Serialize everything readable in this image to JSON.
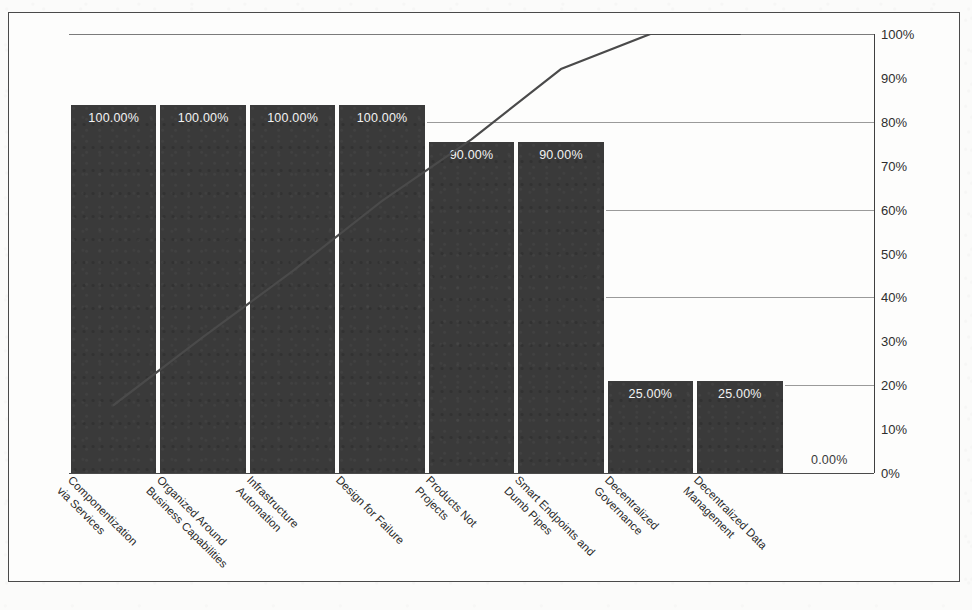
{
  "chart_data": {
    "type": "bar",
    "title": "",
    "subtitle": "",
    "xlabel": "",
    "ylabel": "",
    "ylim": [
      0,
      100
    ],
    "grid": true,
    "legend": "none",
    "categories": [
      "Componentization\nvia Services",
      "Organized Around\nBusiness Capabilities",
      "Infrastructure\nAutomation",
      "Design for Failure",
      "Products Not\nProjects",
      "Smart Endpoints and\nDumb Pipes",
      "Decentralized\nGovernance",
      "Decentralized Data\nManagement"
    ],
    "series": [
      {
        "name": "Percentage",
        "kind": "bar",
        "values": [
          100.0,
          100.0,
          100.0,
          100.0,
          90.0,
          90.0,
          25.0,
          25.0
        ],
        "labels": [
          "100.00%",
          "100.00%",
          "100.00%",
          "100.00%",
          "90.00%",
          "90.00%",
          "25.00%",
          "25.00%"
        ]
      },
      {
        "name": "Cumulative",
        "kind": "line",
        "values": [
          15.5,
          31.0,
          46.0,
          62.0,
          76.0,
          92.0,
          100.0,
          100.0
        ]
      }
    ],
    "extra_labels": [
      {
        "text": "0.00%",
        "x_slot": 8
      }
    ],
    "y_ticks": [
      "0%",
      "10%",
      "20%",
      "30%",
      "40%",
      "50%",
      "60%",
      "70%",
      "80%",
      "90%",
      "100%"
    ],
    "y_gridline_values": [
      0,
      20,
      40,
      60,
      80,
      100
    ],
    "bar_color": "#3a3a3a",
    "line_color": "#4a4a4a",
    "bar_label_color": "#f2f2f2",
    "axis_color": "#4a4a4a",
    "background_color": "#fdfdfc"
  },
  "showthrough": {
    "line1": "THE",
    "line2": "MICROSERVICES",
    "line3": "LANDSCAPE"
  }
}
